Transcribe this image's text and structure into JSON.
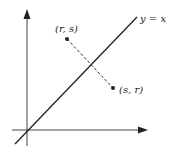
{
  "diagram": {
    "line_label": "y = x",
    "point_a_label": "(r, s)",
    "point_b_label": "(s, r)",
    "colors": {
      "stroke": "#222222",
      "background": "#ffffff"
    }
  }
}
